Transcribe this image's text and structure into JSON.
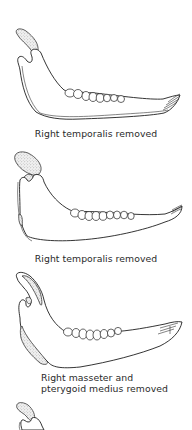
{
  "figure": {
    "panels": [
      {
        "id": "panel-1",
        "caption": "Right temporalis removed",
        "illustration": "mandible-lateral-view"
      },
      {
        "id": "panel-2",
        "caption": "Right temporalis removed",
        "illustration": "mandible-lateral-view"
      },
      {
        "id": "panel-3",
        "caption_line1": "Right masseter and",
        "caption_line2": "pterygoid medius removed",
        "illustration": "mandible-lateral-view"
      },
      {
        "id": "panel-4",
        "caption": "",
        "illustration": "mandible-lateral-view-partial"
      }
    ],
    "colors": {
      "line": "#1e1e1e",
      "muscle_stipple": "#9a9a9a",
      "background": "#ffffff",
      "caption_text": "#2a2a2a"
    }
  }
}
